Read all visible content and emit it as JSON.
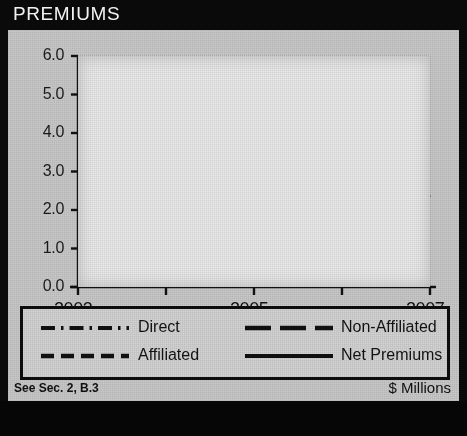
{
  "header": {
    "title": "PREMIUMS"
  },
  "footer": {
    "left_note": "See Sec. 2, B.3",
    "units": "$ Millions"
  },
  "chart_data": {
    "type": "line",
    "title": "PREMIUMS",
    "xlabel": "",
    "ylabel": "",
    "units": "$ Millions",
    "x": [
      2003,
      2004,
      2005,
      2006,
      2007
    ],
    "tick_labels_x": [
      "2003",
      "",
      "2005",
      "",
      "2007"
    ],
    "tick_labels_y": [
      "0.0",
      "1.0",
      "2.0",
      "3.0",
      "4.0",
      "5.0",
      "6.0"
    ],
    "ylim": [
      0.0,
      6.0
    ],
    "ytick_step": 1.0,
    "grid": true,
    "legend_position": "bottom",
    "series": [
      {
        "name": "Direct",
        "style": "dashdot",
        "values": [
          0.1,
          0.1,
          0.1,
          0.1,
          0.1
        ]
      },
      {
        "name": "Affiliated",
        "style": "dashed",
        "values": [
          2.85,
          2.3,
          3.25,
          2.1,
          1.5
        ]
      },
      {
        "name": "Non-Affiliated",
        "style": "longdash",
        "values": [
          2.35,
          1.8,
          1.8,
          1.85,
          2.4
        ]
      },
      {
        "name": "Net Premiums",
        "style": "solid",
        "values": [
          4.9,
          3.85,
          4.65,
          3.8,
          3.7
        ]
      }
    ]
  },
  "colors": {
    "ink": "#121212",
    "header_bg": "#0a0a0a",
    "panel_bg": "#c8c8c8",
    "plot_bg": "#e9e9e9"
  }
}
